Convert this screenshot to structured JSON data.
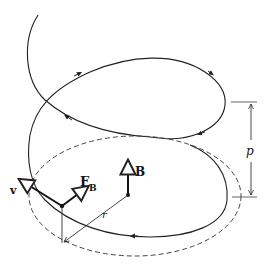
{
  "figure": {
    "labels": {
      "velocity": "v",
      "force_main": "F",
      "force_sub": "B",
      "field": "B",
      "radius": "r",
      "pitch": "p"
    },
    "colors": {
      "stroke": "#222222",
      "dashed": "#444444",
      "background": "#ffffff"
    }
  }
}
